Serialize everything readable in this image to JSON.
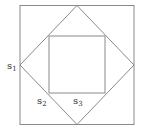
{
  "diagram": {
    "line_color": "#8a8a8a",
    "labels": {
      "s1": {
        "base": "s",
        "sub": "1"
      },
      "s2": {
        "base": "s",
        "sub": "2"
      },
      "s3": {
        "base": "s",
        "sub": "3"
      }
    }
  }
}
